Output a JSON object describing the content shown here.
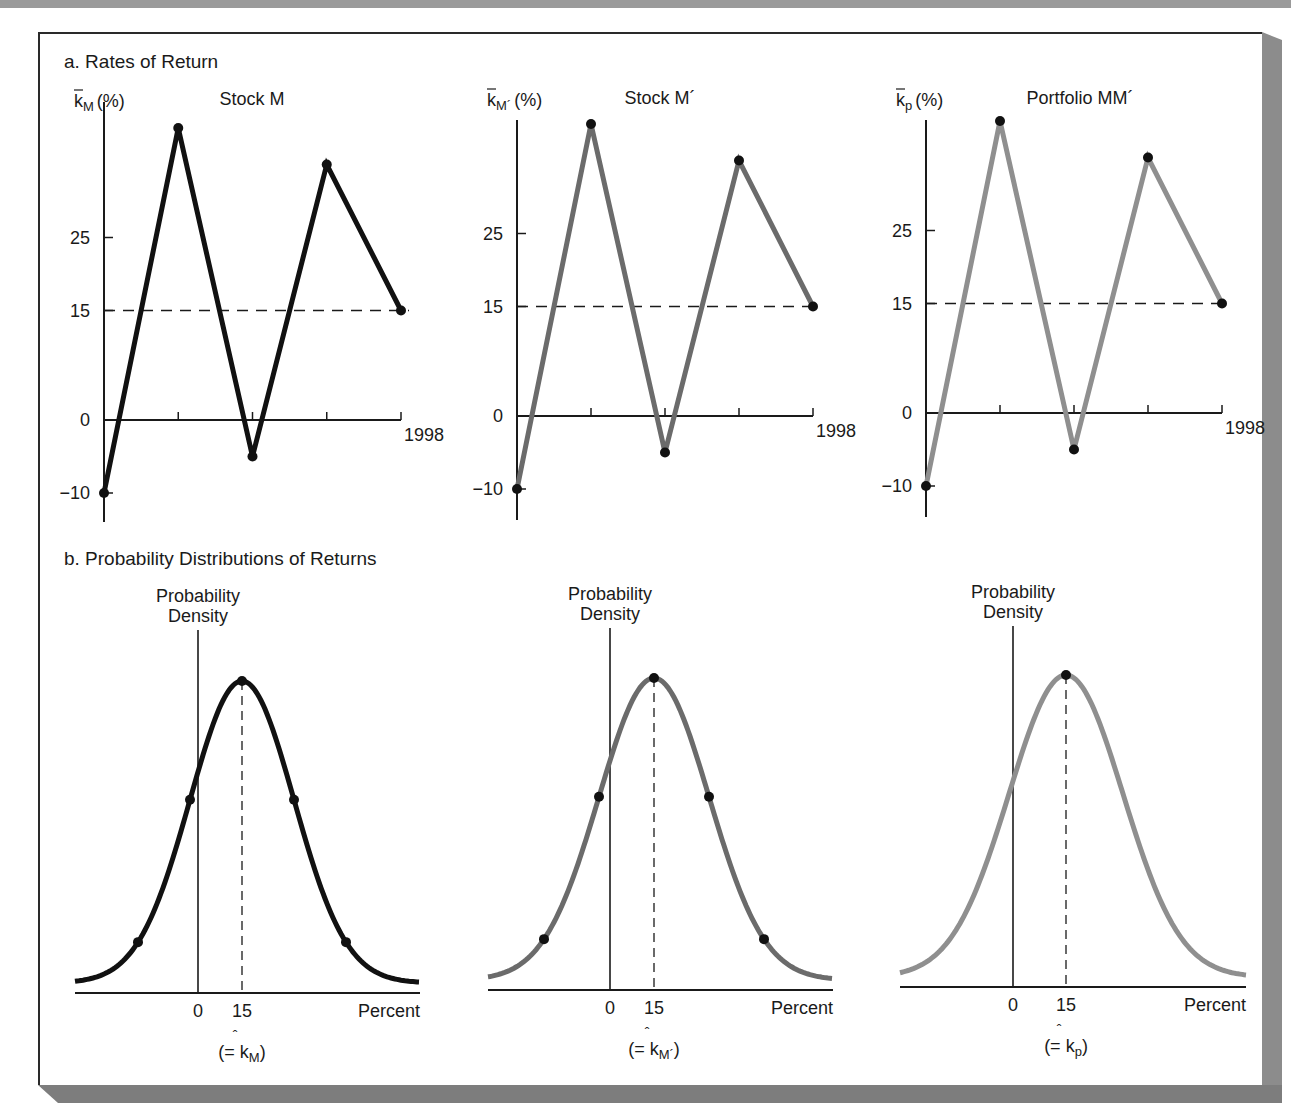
{
  "figure": {
    "section_a_title": "a. Rates of Return",
    "section_b_title": "b. Probability Distributions of Returns",
    "colors": {
      "stock_m": "#111111",
      "stock_m_prime": "#6b6b6b",
      "portfolio": "#8f8f8f",
      "axis": "#1a1a1a",
      "frame_shadow": "#8c8c8c"
    }
  },
  "panels_a": [
    {
      "title": "Stock M",
      "ylabel_base": "k",
      "ylabel_sub": "M",
      "ylabel_suffix": "(%)",
      "y_ticks": [
        "25",
        "15",
        "0",
        "−10"
      ],
      "x_end_label": "1998",
      "mean_label": "15"
    },
    {
      "title": "Stock M´",
      "ylabel_base": "k",
      "ylabel_sub": "M´",
      "ylabel_suffix": "(%)",
      "y_ticks": [
        "25",
        "15",
        "0",
        "−10"
      ],
      "x_end_label": "1998",
      "mean_label": "15"
    },
    {
      "title": "Portfolio MM´",
      "ylabel_base": "k",
      "ylabel_sub": "p",
      "ylabel_suffix": "(%)",
      "y_ticks": [
        "25",
        "15",
        "0",
        "−10"
      ],
      "x_end_label": "1998",
      "mean_label": "15"
    }
  ],
  "panels_b": [
    {
      "ylabel_line1": "Probability",
      "ylabel_line2": "Density",
      "x_tick_0": "0",
      "x_tick_15": "15",
      "x_label": "Percent",
      "note_prefix": "(= ",
      "note_base": "k",
      "note_hat": "ˆ",
      "note_sub": "M",
      "note_suffix": ")"
    },
    {
      "ylabel_line1": "Probability",
      "ylabel_line2": "Density",
      "x_tick_0": "0",
      "x_tick_15": "15",
      "x_label": "Percent",
      "note_prefix": "(= ",
      "note_base": "k",
      "note_hat": "ˆ",
      "note_sub": "M´",
      "note_suffix": ")"
    },
    {
      "ylabel_line1": "Probability",
      "ylabel_line2": "Density",
      "x_tick_0": "0",
      "x_tick_15": "15",
      "x_label": "Percent",
      "note_prefix": "(= ",
      "note_base": "k",
      "note_hat": "ˆ",
      "note_sub": "p",
      "note_suffix": ")"
    }
  ],
  "chart_data": [
    {
      "type": "line",
      "title": "Stock M",
      "xlabel": "",
      "ylabel": "k̄M (%)",
      "x": [
        "1994",
        "1995",
        "1996",
        "1997",
        "1998"
      ],
      "x_tick_labels_shown": [
        "",
        "",
        "",
        "",
        "1998"
      ],
      "series": [
        {
          "name": "Stock M",
          "values": [
            -10,
            40,
            -5,
            35,
            15
          ],
          "color": "#111111"
        }
      ],
      "mean_line": 15,
      "y_ticks": [
        -10,
        0,
        15,
        25
      ],
      "ylim": [
        -13,
        45
      ],
      "grid": false
    },
    {
      "type": "line",
      "title": "Stock M´",
      "xlabel": "",
      "ylabel": "k̄M´ (%)",
      "x": [
        "1994",
        "1995",
        "1996",
        "1997",
        "1998"
      ],
      "x_tick_labels_shown": [
        "",
        "",
        "",
        "",
        "1998"
      ],
      "series": [
        {
          "name": "Stock M´",
          "values": [
            -10,
            40,
            -5,
            35,
            15
          ],
          "color": "#6b6b6b"
        }
      ],
      "mean_line": 15,
      "y_ticks": [
        -10,
        0,
        15,
        25
      ],
      "ylim": [
        -13,
        45
      ],
      "grid": false
    },
    {
      "type": "line",
      "title": "Portfolio MM´",
      "xlabel": "",
      "ylabel": "k̄p (%)",
      "x": [
        "1994",
        "1995",
        "1996",
        "1997",
        "1998"
      ],
      "x_tick_labels_shown": [
        "",
        "",
        "",
        "",
        "1998"
      ],
      "series": [
        {
          "name": "Portfolio MM´",
          "values": [
            -10,
            40,
            -5,
            35,
            15
          ],
          "color": "#8f8f8f"
        }
      ],
      "mean_line": 15,
      "y_ticks": [
        -10,
        0,
        15,
        25
      ],
      "ylim": [
        -13,
        45
      ],
      "grid": false
    },
    {
      "type": "area",
      "title": "Probability Distribution of Returns — Stock M",
      "xlabel": "Percent",
      "ylabel": "Probability Density",
      "distribution": "normal",
      "mean": 15,
      "x_ticks": [
        0,
        15
      ],
      "marked_points": [
        "peak",
        "±1σ",
        "±2σ"
      ],
      "expected_value_label": "k̂M"
    },
    {
      "type": "area",
      "title": "Probability Distribution of Returns — Stock M´",
      "xlabel": "Percent",
      "ylabel": "Probability Density",
      "distribution": "normal",
      "mean": 15,
      "x_ticks": [
        0,
        15
      ],
      "marked_points": [
        "peak",
        "±1σ",
        "±2σ"
      ],
      "expected_value_label": "k̂M´"
    },
    {
      "type": "area",
      "title": "Probability Distribution of Returns — Portfolio MM´",
      "xlabel": "Percent",
      "ylabel": "Probability Density",
      "distribution": "normal",
      "mean": 15,
      "x_ticks": [
        0,
        15
      ],
      "marked_points": [
        "peak"
      ],
      "expected_value_label": "k̂p"
    }
  ]
}
